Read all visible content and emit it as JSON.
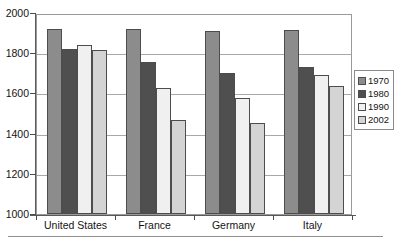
{
  "chart_data": {
    "type": "bar",
    "title": "",
    "subtitle": "",
    "xlabel": "",
    "ylabel": "",
    "categories": [
      "United States",
      "France",
      "Germany",
      "Italy"
    ],
    "series": [
      {
        "name": "1970",
        "values": [
          1920,
          1920,
          1910,
          1915
        ],
        "color": "#8c8c8c"
      },
      {
        "name": "1980",
        "values": [
          1820,
          1755,
          1700,
          1730
        ],
        "color": "#4f4f4f"
      },
      {
        "name": "1990",
        "values": [
          1840,
          1625,
          1575,
          1690
        ],
        "color": "#f0f0f0"
      },
      {
        "name": "2002",
        "values": [
          1815,
          1470,
          1455,
          1635
        ],
        "color": "#d4d4d4"
      }
    ],
    "ylim": [
      1000,
      2000
    ],
    "yticks": [
      1000,
      1200,
      1400,
      1600,
      1800,
      2000
    ],
    "ytick_labels": [
      "1000",
      "1200",
      "1400",
      "1600",
      "1800",
      "2000"
    ],
    "grid": true,
    "grid_axis": "y",
    "legend_position": "right",
    "legend_entries": [
      "1970",
      "1980",
      "1990",
      "2002"
    ]
  },
  "axes": {
    "y_tick_labels": [
      "2000",
      "1800",
      "1600",
      "1400",
      "1200",
      "1000"
    ],
    "x_category_labels": [
      "United States",
      "France",
      "Germany",
      "Italy"
    ]
  },
  "legend": {
    "items": [
      {
        "label": "1970"
      },
      {
        "label": "1980"
      },
      {
        "label": "1990"
      },
      {
        "label": "2002"
      }
    ]
  }
}
